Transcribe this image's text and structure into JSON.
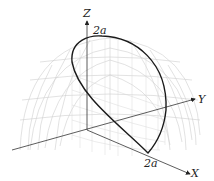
{
  "figure": {
    "type": "3d-surface-intersection",
    "axes": {
      "z_label": "Z",
      "y_label": "Y",
      "x_label": "X"
    },
    "annotations": {
      "top_value": "2a",
      "x_value": "2a"
    },
    "colors": {
      "curve": "#1a1a1a",
      "axes": "#333333",
      "mesh": "#c8c8c8"
    }
  }
}
